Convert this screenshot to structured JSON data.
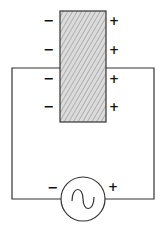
{
  "diagram": {
    "element": {
      "label": "polarized-slab",
      "hatch": "diagonal",
      "fill": "#d8d8d8",
      "stroke": "#333333"
    },
    "left_charges": [
      "−",
      "−",
      "−",
      "−"
    ],
    "right_charges": [
      "+",
      "+",
      "+",
      "+"
    ],
    "source": {
      "type": "AC",
      "symbol": "~",
      "minus": "−",
      "plus": "+"
    },
    "wire_color": "#333333"
  }
}
